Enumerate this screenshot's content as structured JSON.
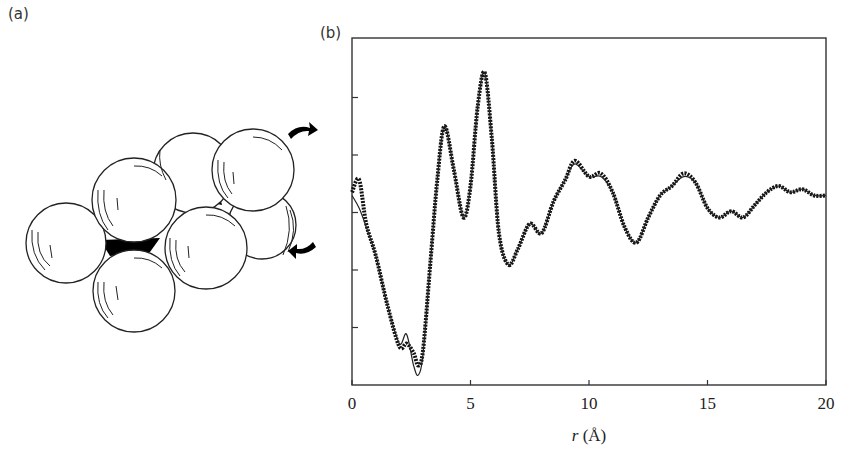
{
  "panels": {
    "a": {
      "label": "(a)",
      "description": "Cluster of close-packed spheres with tetrahedral voids shaded black; curved arrows indicate rotation"
    },
    "b": {
      "label": "(b)"
    }
  },
  "chart_data": {
    "type": "line",
    "title": "",
    "xlabel_var": "r",
    "xlabel_unit": "(Å)",
    "xlabel": "r (Å)",
    "ylabel": "",
    "xlim": [
      0,
      20
    ],
    "x_ticks": [
      "0",
      "5",
      "10",
      "15",
      "20"
    ],
    "y_ticks_unlabeled": 5,
    "grid": false,
    "legend": null,
    "series": [
      {
        "name": "experimental (points)",
        "style": "markers",
        "x": [
          0.0,
          0.3,
          0.6,
          1.0,
          1.5,
          2.0,
          2.3,
          2.6,
          2.8,
          3.0,
          3.3,
          3.6,
          3.9,
          4.3,
          4.7,
          5.0,
          5.3,
          5.6,
          5.9,
          6.2,
          6.6,
          7.0,
          7.5,
          8.0,
          8.5,
          9.0,
          9.4,
          10.0,
          10.5,
          11.0,
          11.5,
          12.0,
          12.5,
          13.0,
          13.5,
          14.0,
          14.5,
          15.0,
          15.5,
          16.0,
          16.5,
          17.0,
          17.5,
          18.0,
          18.5,
          19.0,
          19.5,
          20.0
        ],
        "y": [
          0.58,
          0.62,
          0.48,
          0.38,
          0.22,
          0.09,
          0.1,
          0.07,
          0.03,
          0.08,
          0.35,
          0.62,
          0.79,
          0.65,
          0.5,
          0.6,
          0.85,
          0.96,
          0.75,
          0.45,
          0.35,
          0.4,
          0.48,
          0.45,
          0.55,
          0.62,
          0.68,
          0.63,
          0.64,
          0.58,
          0.47,
          0.42,
          0.5,
          0.57,
          0.6,
          0.64,
          0.61,
          0.53,
          0.5,
          0.52,
          0.5,
          0.54,
          0.58,
          0.6,
          0.58,
          0.59,
          0.57,
          0.57
        ]
      },
      {
        "name": "model (line)",
        "style": "line",
        "x": [
          0.0,
          0.3,
          0.6,
          1.0,
          1.5,
          2.0,
          2.3,
          2.6,
          2.8,
          3.0,
          3.3,
          3.6,
          3.9,
          4.3,
          4.7,
          5.0,
          5.3,
          5.6,
          5.9,
          6.2,
          6.6,
          7.0,
          7.5,
          8.0,
          8.5,
          9.0,
          9.4,
          10.0,
          10.5,
          11.0,
          11.5,
          12.0,
          12.5,
          13.0,
          13.5,
          14.0,
          14.5,
          15.0,
          15.5,
          16.0,
          16.5,
          17.0,
          17.5,
          18.0,
          18.5,
          19.0,
          19.5,
          20.0
        ],
        "y": [
          0.57,
          0.53,
          0.47,
          0.38,
          0.22,
          0.1,
          0.13,
          0.03,
          0.0,
          0.07,
          0.35,
          0.62,
          0.79,
          0.65,
          0.5,
          0.6,
          0.85,
          0.96,
          0.75,
          0.45,
          0.35,
          0.4,
          0.48,
          0.45,
          0.55,
          0.62,
          0.67,
          0.63,
          0.63,
          0.58,
          0.47,
          0.42,
          0.5,
          0.57,
          0.6,
          0.63,
          0.61,
          0.53,
          0.5,
          0.52,
          0.5,
          0.54,
          0.58,
          0.6,
          0.58,
          0.59,
          0.57,
          0.57
        ]
      }
    ]
  }
}
